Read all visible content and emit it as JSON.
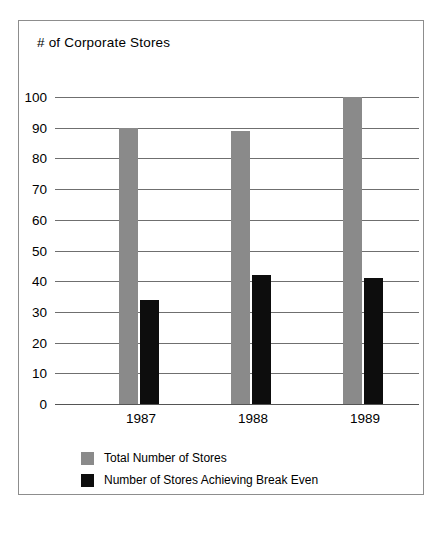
{
  "chart_data": {
    "type": "bar",
    "title": "# of Corporate Stores",
    "xlabel": "",
    "ylabel": "",
    "categories": [
      "1987",
      "1988",
      "1989"
    ],
    "series": [
      {
        "name": "Total Number of Stores",
        "color": "#8a8a8a",
        "values": [
          90,
          89,
          100
        ]
      },
      {
        "name": "Number of Stores Achieving Break Even",
        "color": "#0d0d0d",
        "values": [
          34,
          42,
          41
        ]
      }
    ],
    "ylim": [
      0,
      100
    ],
    "yticks": [
      "0",
      "10",
      "20",
      "30",
      "40",
      "50",
      "60",
      "70",
      "80",
      "90",
      "100"
    ],
    "grid": true,
    "legend_position": "bottom-left"
  },
  "frame": {
    "border_color": "#8d8d8d"
  }
}
